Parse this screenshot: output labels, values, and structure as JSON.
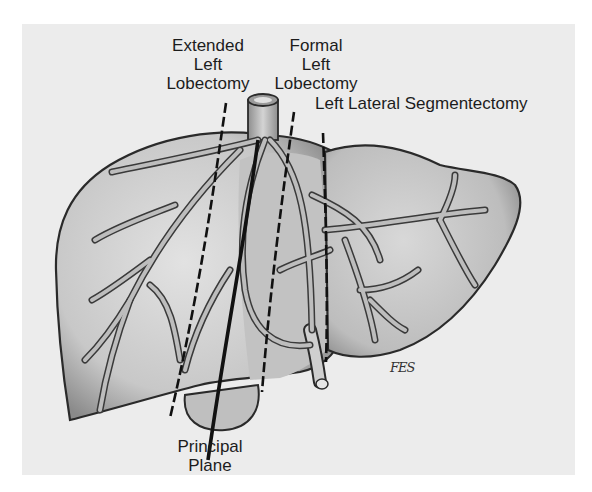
{
  "figure": {
    "colors": {
      "background_outer": "#ffffff",
      "background_panel": "#ececec",
      "liver_fill": "#c9c9c9",
      "liver_outline": "#2a2a2a",
      "vessel_fill": "#b0b0b0",
      "line_color": "#111111"
    }
  },
  "labels": {
    "extended_left_lobectomy": {
      "line1": "Extended",
      "line2": "Left",
      "line3": "Lobectomy"
    },
    "formal_left_lobectomy": {
      "line1": "Formal",
      "line2": "Left",
      "line3": "Lobectomy"
    },
    "left_lateral_segmentectomy": {
      "text": "Left Lateral Segmentectomy"
    },
    "principal_plane": {
      "line1": "Principal",
      "line2": "Plane"
    }
  },
  "signature": "FES",
  "planes": [
    {
      "name": "Extended Left Lobectomy",
      "style": "dashed"
    },
    {
      "name": "Principal Plane",
      "style": "solid"
    },
    {
      "name": "Formal Left Lobectomy",
      "style": "dashed"
    },
    {
      "name": "Left Lateral Segmentectomy",
      "style": "dashed"
    }
  ]
}
